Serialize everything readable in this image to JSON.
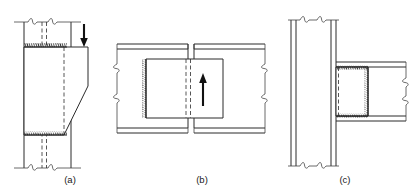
{
  "figure": {
    "background_color": "#ffffff",
    "line_color": "#2b2b2b",
    "weld_color": "#242424",
    "arrow_color": "#111111",
    "caption_color": "#1a1a1a",
    "panels": [
      {
        "id": "a",
        "label": "(a)",
        "label_x": 70,
        "label_y": 183,
        "description": "Column with welded tapered bracket plate, downward load arrow",
        "member_type": "column",
        "member_orientation": "vertical",
        "plate_shape": "tapered-bracket",
        "arrow_direction": "down",
        "break_symbol_count": 4,
        "weld_edges": [
          "top",
          "bottom"
        ],
        "centerline": "vertical-dashed"
      },
      {
        "id": "b",
        "label": "(b)",
        "label_x": 202,
        "label_y": 183,
        "description": "Beam splice with welded rectangular web plate, upward load arrow",
        "member_type": "beam",
        "member_orientation": "horizontal",
        "plate_shape": "rectangular",
        "arrow_direction": "up",
        "break_symbol_count": 4,
        "weld_edges": [
          "left"
        ],
        "centerline": "vertical-dashed"
      },
      {
        "id": "c",
        "label": "(c)",
        "label_x": 345,
        "label_y": 183,
        "description": "Beam to column moment connection with welded end plate",
        "member_type": "column-and-beam",
        "member_orientation": "tee",
        "plate_shape": "rectangular",
        "arrow_direction": "none",
        "break_symbol_count": 4,
        "weld_edges": [
          "top",
          "right",
          "bottom"
        ],
        "centerline": "vertical-dashed"
      }
    ]
  }
}
